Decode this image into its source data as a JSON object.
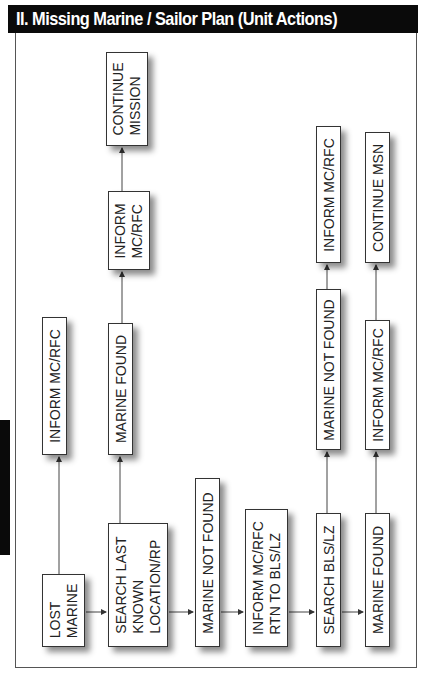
{
  "header": {
    "title": "II. Missing Marine / Sailor Plan (Unit Actions)"
  },
  "diagram": {
    "orientation": "rotated -90deg (text reads bottom-to-top)",
    "nodes": [
      {
        "id": "lost-marine",
        "label": "LOST\nMARINE"
      },
      {
        "id": "search-last-known",
        "label": "SEARCH LAST\nKNOWN\nLOCATION/RP"
      },
      {
        "id": "marine-not-found-1",
        "label": "MARINE NOT FOUND"
      },
      {
        "id": "inform-rtn",
        "label": "INFORM MC/RFC\nRTN TO BLS/LZ"
      },
      {
        "id": "search-bls",
        "label": "SEARCH BLS/LZ"
      },
      {
        "id": "marine-found-2",
        "label": "MARINE FOUND"
      },
      {
        "id": "inform-1",
        "label": "INFORM MC/RFC"
      },
      {
        "id": "marine-found-1",
        "label": "MARINE FOUND"
      },
      {
        "id": "inform-2",
        "label": "INFORM\nMC/RFC"
      },
      {
        "id": "continue-mission",
        "label": "CONTINUE\nMISSION"
      },
      {
        "id": "marine-not-found-2",
        "label": "MARINE NOT FOUND"
      },
      {
        "id": "inform-3",
        "label": "INFORM MC/RFC"
      },
      {
        "id": "inform-4",
        "label": "INFORM MC/RFC"
      },
      {
        "id": "continue-msn",
        "label": "CONTINUE MSN"
      }
    ],
    "edges": [
      [
        "lost-marine",
        "search-last-known"
      ],
      [
        "lost-marine",
        "inform-1"
      ],
      [
        "search-last-known",
        "marine-not-found-1"
      ],
      [
        "search-last-known",
        "marine-found-1"
      ],
      [
        "marine-found-1",
        "inform-2"
      ],
      [
        "inform-2",
        "continue-mission"
      ],
      [
        "marine-not-found-1",
        "inform-rtn"
      ],
      [
        "inform-rtn",
        "search-bls"
      ],
      [
        "search-bls",
        "marine-found-2"
      ],
      [
        "search-bls",
        "marine-not-found-2"
      ],
      [
        "marine-not-found-2",
        "inform-3"
      ],
      [
        "marine-found-2",
        "inform-4"
      ],
      [
        "inform-4",
        "continue-msn"
      ]
    ]
  }
}
